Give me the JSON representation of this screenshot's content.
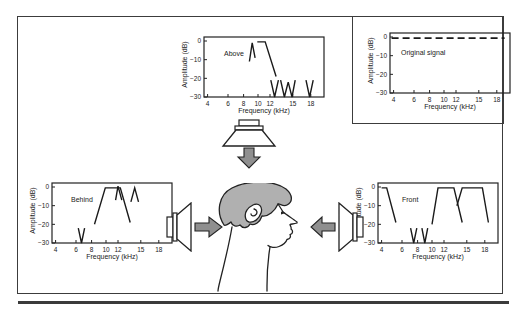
{
  "figure": {
    "caption_text": "",
    "colors": {
      "line": "#3c3c3c",
      "ink": "#222222",
      "hair_gray": "#b0b0b0",
      "arrow_gray": "#8f8f8f",
      "rule": "#3b3b3b",
      "background": "#ffffff"
    },
    "listener": "human-head-profile-facing-right",
    "speakers": [
      {
        "name": "speaker-above",
        "arrow_direction": "down"
      },
      {
        "name": "speaker-behind",
        "arrow_direction": "right"
      },
      {
        "name": "speaker-front",
        "arrow_direction": "left"
      }
    ]
  },
  "chart_data": [
    {
      "key": "above",
      "type": "line",
      "title": "Above",
      "xlabel": "Frequency (kHz)",
      "ylabel": "Amplitude (dB)",
      "xticks": [
        4,
        6,
        8,
        10,
        12,
        15,
        18
      ],
      "yticks": [
        0,
        -10,
        -20,
        -30
      ],
      "xlim": [
        3.8,
        19.5
      ],
      "ylim": [
        -30,
        0
      ],
      "xscale": "log",
      "grid": false,
      "series": [
        {
          "name": "peak-9kHz",
          "style": "solid",
          "points": [
            [
              8.8,
              -11
            ],
            [
              9.2,
              -1
            ],
            [
              9.6,
              -9
            ]
          ]
        },
        {
          "name": "plateau-and-rolloff",
          "style": "solid",
          "points": [
            [
              9.9,
              -0.5
            ],
            [
              11.2,
              -0.5
            ],
            [
              12.8,
              -19
            ]
          ]
        },
        {
          "name": "notch-12.6kHz",
          "style": "solid",
          "points": [
            [
              12.1,
              -21
            ],
            [
              12.6,
              -30
            ],
            [
              13.1,
              -21
            ]
          ]
        },
        {
          "name": "double-notch-13.9-14.9kHz",
          "style": "solid",
          "points": [
            [
              13.4,
              -21
            ],
            [
              13.9,
              -30
            ],
            [
              14.4,
              -22
            ],
            [
              14.9,
              -30
            ],
            [
              15.4,
              -21
            ]
          ]
        },
        {
          "name": "notch-17.8kHz",
          "style": "solid",
          "points": [
            [
              17.2,
              -21
            ],
            [
              17.8,
              -30
            ],
            [
              18.4,
              -21
            ]
          ]
        }
      ]
    },
    {
      "key": "original",
      "type": "line",
      "title": "Original signal",
      "xlabel": "Frequency (kHz)",
      "ylabel": "Amplitude (dB)",
      "xticks": [
        4,
        6,
        8,
        10,
        12,
        15,
        18
      ],
      "yticks": [
        0,
        -10,
        -20,
        -30
      ],
      "xlim": [
        3.8,
        19.5
      ],
      "ylim": [
        -30,
        0
      ],
      "xscale": "log",
      "grid": false,
      "series": [
        {
          "name": "flat-0dB",
          "style": "dashed",
          "points": [
            [
              3.8,
              -0.6
            ],
            [
              19.3,
              -0.6
            ]
          ]
        }
      ]
    },
    {
      "key": "behind",
      "type": "line",
      "title": "Behind",
      "xlabel": "Frequency (kHz)",
      "ylabel": "Amplitude (dB)",
      "xticks": [
        4,
        6,
        8,
        10,
        12,
        15,
        18
      ],
      "yticks": [
        0,
        -10,
        -20,
        -30
      ],
      "xlim": [
        3.8,
        19.5
      ],
      "ylim": [
        -30,
        0
      ],
      "xscale": "log",
      "grid": false,
      "series": [
        {
          "name": "notch-6.7kHz",
          "style": "solid",
          "points": [
            [
              6.3,
              -22
            ],
            [
              6.7,
              -30
            ],
            [
              7.1,
              -22
            ]
          ]
        },
        {
          "name": "passband-8.5-13.5kHz",
          "style": "solid",
          "points": [
            [
              8.4,
              -20
            ],
            [
              9.9,
              -0.5
            ],
            [
              12.3,
              -0.5
            ],
            [
              13.6,
              -19
            ]
          ]
        },
        {
          "name": "peak-12kHz",
          "style": "solid",
          "points": [
            [
              11.6,
              -7
            ],
            [
              12.0,
              0.5
            ],
            [
              12.5,
              -7
            ]
          ]
        },
        {
          "name": "peak-14.2kHz",
          "style": "solid",
          "points": [
            [
              13.7,
              -8
            ],
            [
              14.2,
              -0.5
            ],
            [
              14.7,
              -8
            ]
          ]
        }
      ]
    },
    {
      "key": "front",
      "type": "line",
      "title": "Front",
      "xlabel": "Frequency (kHz)",
      "ylabel": "Amplitude (dB)",
      "xticks": [
        4,
        6,
        8,
        10,
        12,
        15,
        18
      ],
      "yticks": [
        0,
        -10,
        -20,
        -30
      ],
      "xlim": [
        3.8,
        19.5
      ],
      "ylim": [
        -30,
        0
      ],
      "xscale": "log",
      "grid": false,
      "series": [
        {
          "name": "low-edge-rolloff",
          "style": "solid",
          "points": [
            [
              4.0,
              -0.5
            ],
            [
              4.5,
              -0.5
            ],
            [
              5.4,
              -19
            ]
          ]
        },
        {
          "name": "notch-7.5kHz",
          "style": "solid",
          "points": [
            [
              7.1,
              -22
            ],
            [
              7.5,
              -30
            ],
            [
              7.9,
              -22
            ]
          ]
        },
        {
          "name": "notch-9kHz",
          "style": "solid",
          "points": [
            [
              8.6,
              -22
            ],
            [
              9.0,
              -30
            ],
            [
              9.4,
              -22
            ]
          ]
        },
        {
          "name": "passband-10-14.5kHz",
          "style": "solid",
          "points": [
            [
              10.0,
              -20
            ],
            [
              11.0,
              -0.5
            ],
            [
              13.3,
              -0.5
            ],
            [
              14.4,
              -19
            ]
          ]
        },
        {
          "name": "passband-14-18.6kHz",
          "style": "solid",
          "points": [
            [
              13.7,
              -10
            ],
            [
              14.4,
              -0.5
            ],
            [
              17.6,
              -0.5
            ],
            [
              18.6,
              -19
            ]
          ]
        }
      ]
    }
  ]
}
